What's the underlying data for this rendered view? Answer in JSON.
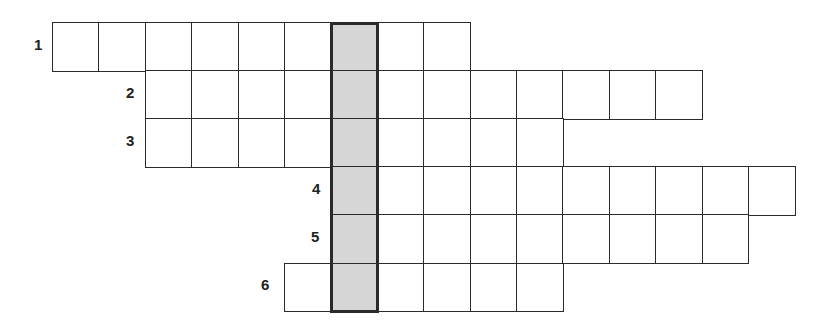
{
  "puzzle": {
    "type": "crossword-keyword",
    "grid": {
      "origin_x": 52,
      "origin_y": 22,
      "cell_width": 46.4,
      "cell_height": 48.1,
      "key_column": 6,
      "key_fill": "#d6d6d6",
      "line_color": "#2a2a2a"
    },
    "rows": [
      {
        "number": "1",
        "start_col": 0,
        "length": 9,
        "label_x": 34,
        "label_y": 37
      },
      {
        "number": "2",
        "start_col": 2,
        "length": 12,
        "label_x": 126,
        "label_y": 85
      },
      {
        "number": "3",
        "start_col": 2,
        "length": 9,
        "label_x": 126,
        "label_y": 133
      },
      {
        "number": "4",
        "start_col": 6,
        "length": 10,
        "label_x": 312,
        "label_y": 181
      },
      {
        "number": "5",
        "start_col": 6,
        "length": 9,
        "label_x": 311,
        "label_y": 229
      },
      {
        "number": "6",
        "start_col": 5,
        "length": 6,
        "label_x": 261,
        "label_y": 277
      }
    ]
  }
}
